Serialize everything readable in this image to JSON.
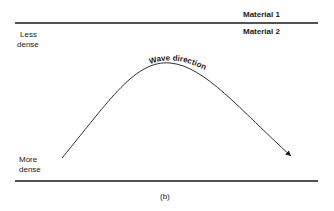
{
  "labels": {
    "material1": "Material 1",
    "material2": "Material 2",
    "less_dense_1": "Less",
    "less_dense_2": "dense",
    "more_dense_1": "More",
    "more_dense_2": "dense",
    "wave_direction": "Wave direction",
    "caption": "(b)"
  }
}
